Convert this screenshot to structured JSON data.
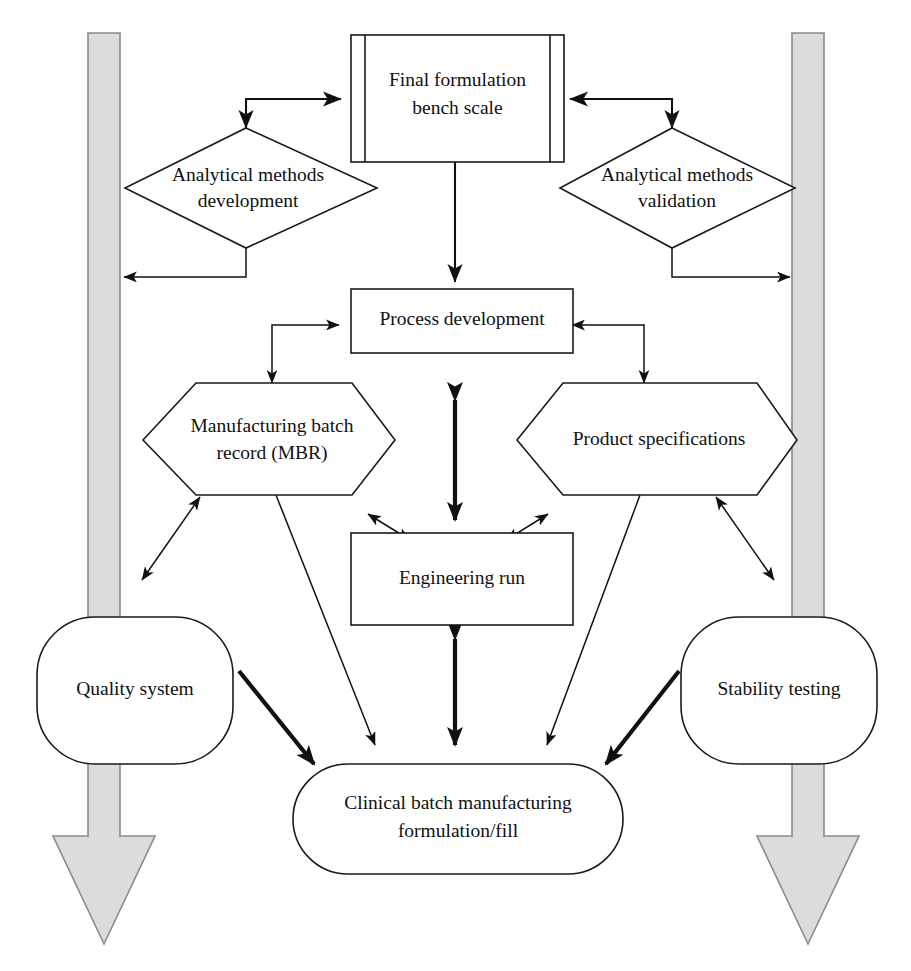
{
  "diagram": {
    "type": "flowchart",
    "background_color": "#ffffff",
    "line_color": "#111111",
    "band_fill_color": "#dcdcdc",
    "band_stroke_color": "#8a8a8a",
    "nodes": {
      "final_formulation": {
        "label_line1": "Final formulation",
        "label_line2": "bench scale",
        "shape": "predefined-process"
      },
      "analytical_development": {
        "label_line1": "Analytical methods",
        "label_line2": "development",
        "shape": "diamond"
      },
      "analytical_validation": {
        "label_line1": "Analytical methods",
        "label_line2": "validation",
        "shape": "diamond"
      },
      "process_development": {
        "label_line1": "Process development",
        "shape": "rectangle"
      },
      "mbr": {
        "label_line1": "Manufacturing batch",
        "label_line2": "record (MBR)",
        "shape": "hexagon"
      },
      "product_specifications": {
        "label_line1": "Product specifications",
        "shape": "hexagon"
      },
      "engineering_run": {
        "label_line1": "Engineering run",
        "shape": "rectangle"
      },
      "quality_system": {
        "label_line1": "Quality system",
        "shape": "rounded-rectangle"
      },
      "stability_testing": {
        "label_line1": "Stability testing",
        "shape": "rounded-rectangle"
      },
      "clinical_batch": {
        "label_line1": "Clinical batch manufacturing",
        "label_line2": "formulation/fill",
        "shape": "stadium"
      }
    },
    "bands": {
      "left": {
        "name": "left-process-band",
        "direction": "down"
      },
      "right": {
        "name": "right-process-band",
        "direction": "down"
      }
    },
    "connectors": [
      {
        "from": "analytical_development",
        "to": "final_formulation",
        "style": "double-headed-elbow"
      },
      {
        "from": "analytical_validation",
        "to": "final_formulation",
        "style": "double-headed-elbow"
      },
      {
        "from": "analytical_development",
        "to": "left-process-band",
        "style": "single-arrow-elbow"
      },
      {
        "from": "analytical_validation",
        "to": "right-process-band",
        "style": "single-arrow-elbow"
      },
      {
        "from": "final_formulation",
        "to": "process_development",
        "style": "single-arrow"
      },
      {
        "from": "process_development",
        "to": "mbr",
        "style": "double-headed-elbow"
      },
      {
        "from": "process_development",
        "to": "product_specifications",
        "style": "double-headed-elbow"
      },
      {
        "from": "process_development",
        "to": "engineering_run",
        "style": "double-headed"
      },
      {
        "from": "mbr",
        "to": "engineering_run",
        "style": "double-headed"
      },
      {
        "from": "product_specifications",
        "to": "engineering_run",
        "style": "double-headed"
      },
      {
        "from": "mbr",
        "to": "quality_system",
        "style": "double-headed"
      },
      {
        "from": "product_specifications",
        "to": "stability_testing",
        "style": "double-headed"
      },
      {
        "from": "engineering_run",
        "to": "clinical_batch",
        "style": "double-headed"
      },
      {
        "from": "mbr",
        "to": "clinical_batch",
        "style": "single-arrow"
      },
      {
        "from": "product_specifications",
        "to": "clinical_batch",
        "style": "single-arrow"
      },
      {
        "from": "quality_system",
        "to": "clinical_batch",
        "style": "single-arrow-thick"
      },
      {
        "from": "stability_testing",
        "to": "clinical_batch",
        "style": "single-arrow-thick"
      }
    ]
  }
}
